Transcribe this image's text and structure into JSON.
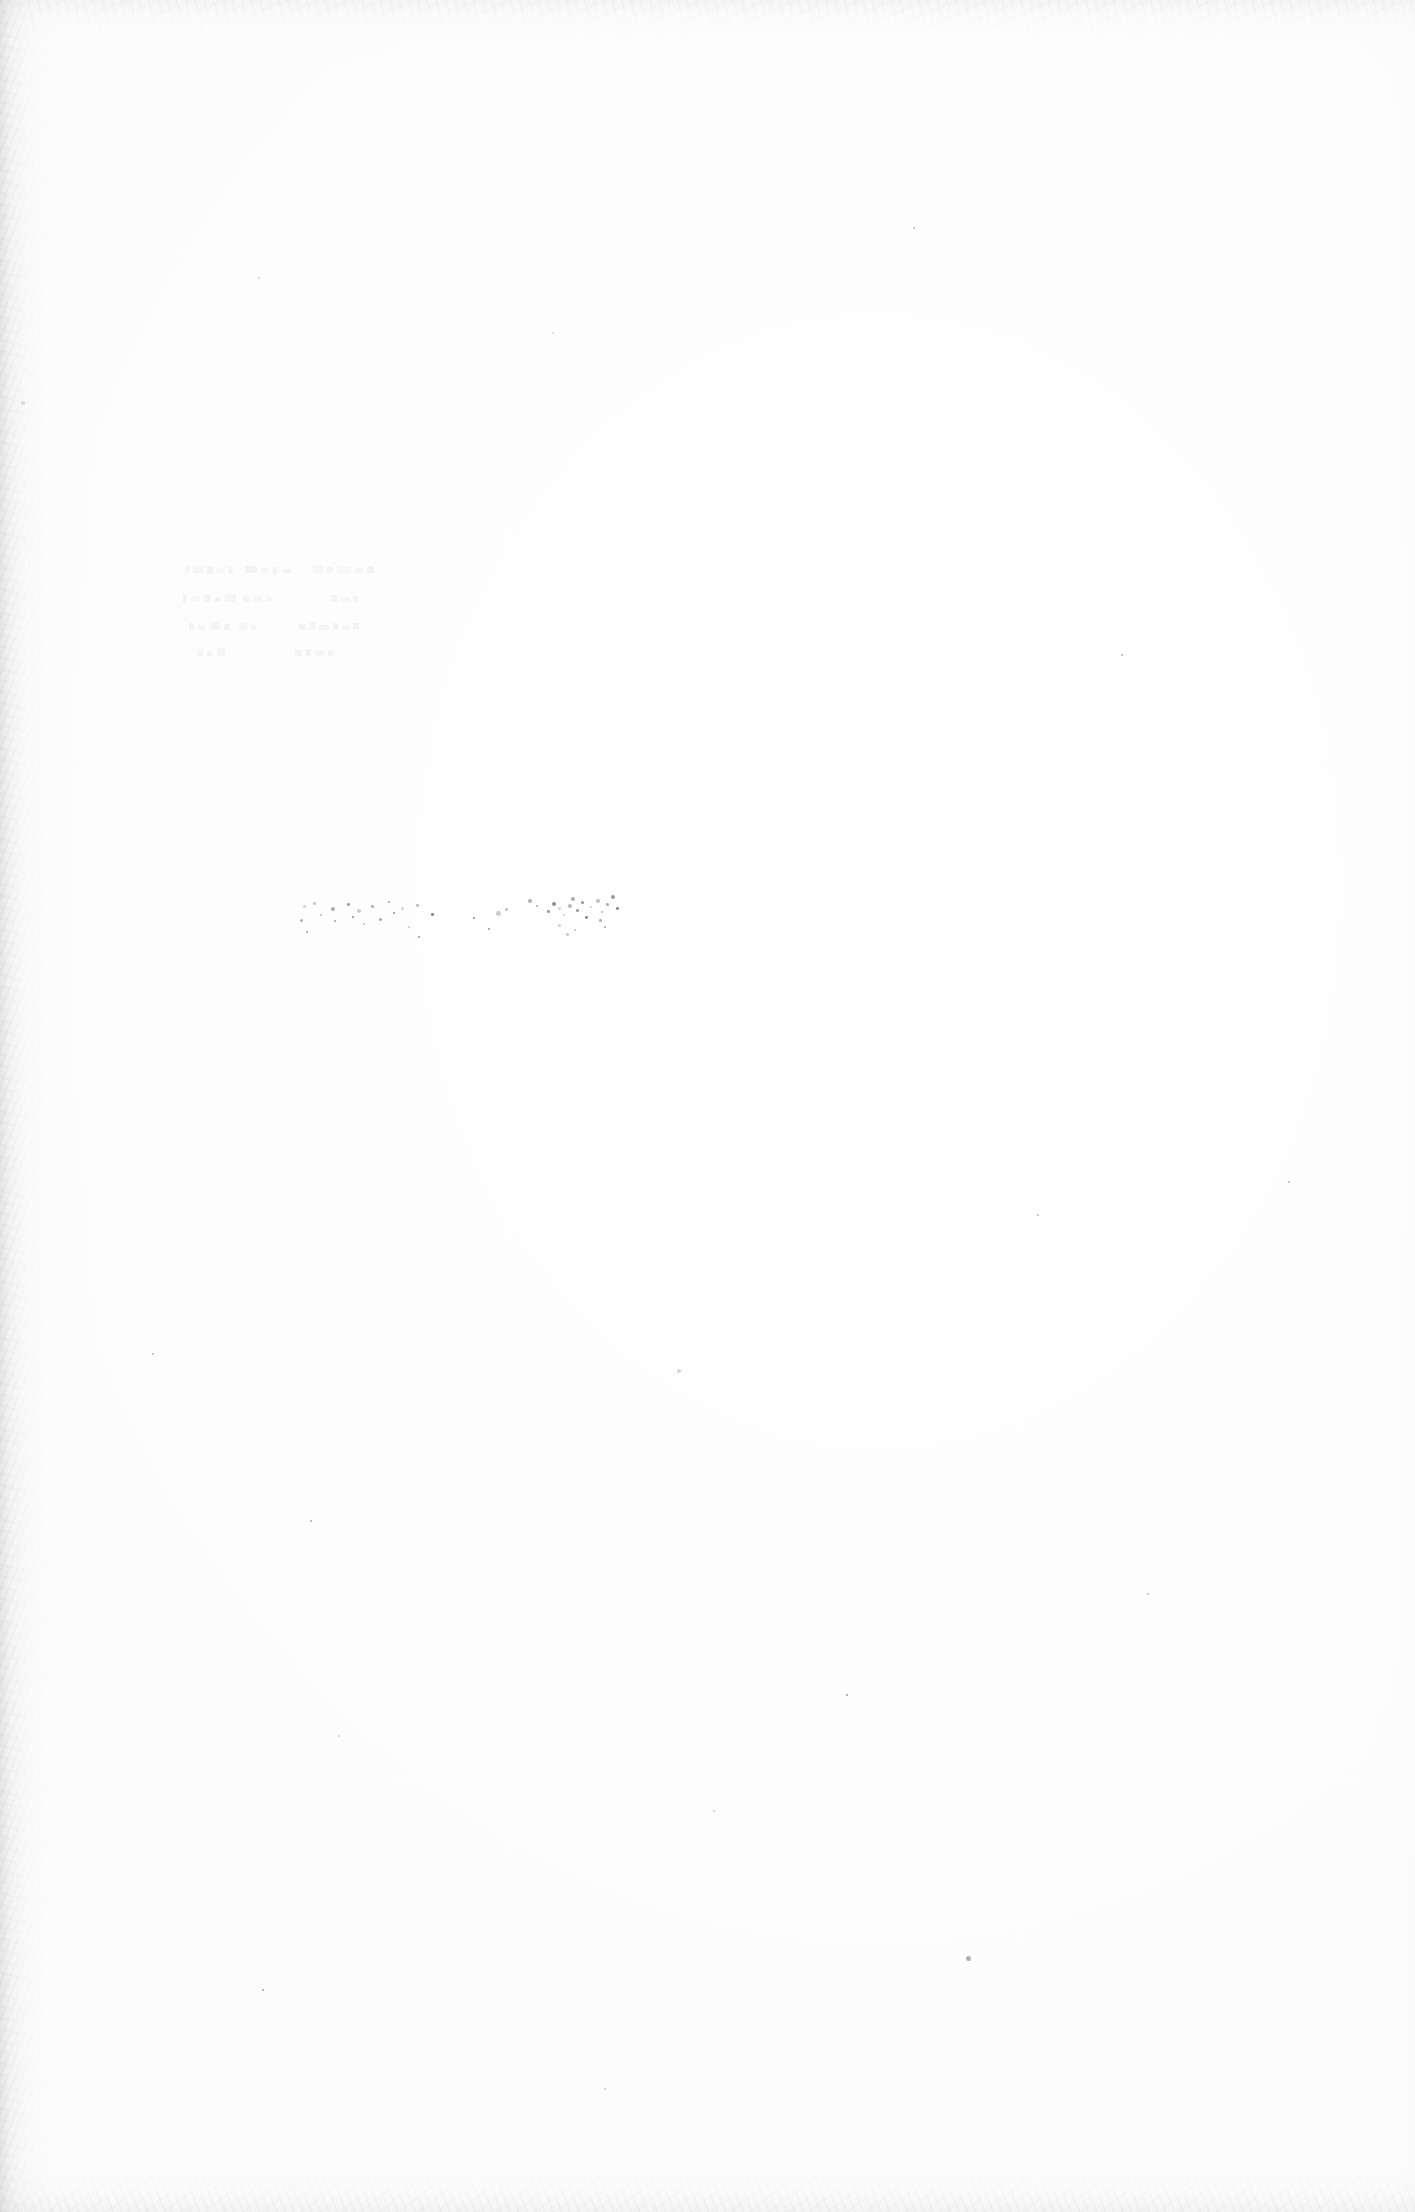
{
  "document": {
    "kind": "scanned-page",
    "orientation": "portrait",
    "page_width_px": 1415,
    "page_height_px": 2212,
    "visible_text": "",
    "legible_text_present": false,
    "description_label": "Blank scanned page with faint residual marks"
  },
  "colors": {
    "paper": "#fefefe",
    "paper_shade": "#fcfcfc",
    "edge_shadow": "#b0b0b2",
    "speck": "#6d6d72",
    "ghost_mark": "#9a9aa0"
  },
  "artifacts": {
    "edge_shadows": [
      {
        "name": "left-binding-shadow",
        "edge": "left",
        "extent_px": 95,
        "strength": 0.3
      },
      {
        "name": "top-edge-shadow",
        "edge": "top",
        "extent_px": 70,
        "strength": 0.13
      },
      {
        "name": "bottom-edge-shadow",
        "edge": "bottom",
        "extent_px": 85,
        "strength": 0.15
      },
      {
        "name": "right-edge-shadow",
        "edge": "right",
        "extent_px": 48,
        "strength": 0.06
      }
    ]
  },
  "ghost_text": {
    "present": true,
    "legible": false,
    "note": "Three short rows of faint, unreadable residual marks",
    "region": {
      "x": 183,
      "y": 563,
      "width": 198,
      "height": 100
    },
    "lines": [
      {
        "top": 0,
        "height": 13,
        "marks": [
          [
            2,
            2,
            5,
            9
          ],
          [
            10,
            4,
            10,
            6
          ],
          [
            24,
            3,
            6,
            8
          ],
          [
            33,
            5,
            9,
            5
          ],
          [
            45,
            4,
            5,
            7
          ],
          [
            62,
            3,
            12,
            7
          ],
          [
            78,
            5,
            7,
            5
          ],
          [
            90,
            4,
            4,
            8
          ],
          [
            100,
            6,
            8,
            4
          ],
          [
            130,
            2,
            10,
            8
          ],
          [
            144,
            4,
            6,
            6
          ],
          [
            154,
            3,
            14,
            8
          ],
          [
            172,
            5,
            8,
            5
          ],
          [
            184,
            3,
            7,
            7
          ]
        ]
      },
      {
        "top": 28,
        "height": 13,
        "marks": [
          [
            0,
            3,
            4,
            9
          ],
          [
            8,
            5,
            9,
            5
          ],
          [
            21,
            4,
            7,
            7
          ],
          [
            32,
            6,
            5,
            5
          ],
          [
            42,
            3,
            11,
            8
          ],
          [
            60,
            5,
            6,
            6
          ],
          [
            70,
            4,
            9,
            6
          ],
          [
            84,
            6,
            5,
            4
          ],
          [
            148,
            4,
            6,
            7
          ],
          [
            158,
            6,
            9,
            5
          ],
          [
            170,
            5,
            5,
            6
          ]
        ]
      },
      {
        "top": 56,
        "height": 13,
        "marks": [
          [
            6,
            4,
            5,
            8
          ],
          [
            15,
            6,
            7,
            5
          ],
          [
            27,
            3,
            10,
            8
          ],
          [
            41,
            5,
            6,
            6
          ],
          [
            56,
            4,
            8,
            7
          ],
          [
            68,
            6,
            5,
            5
          ],
          [
            116,
            5,
            7,
            6
          ],
          [
            126,
            3,
            6,
            8
          ],
          [
            136,
            6,
            10,
            5
          ],
          [
            150,
            4,
            5,
            7
          ],
          [
            159,
            6,
            8,
            5
          ],
          [
            170,
            4,
            6,
            6
          ]
        ]
      },
      {
        "top": 82,
        "height": 12,
        "marks": [
          [
            14,
            4,
            6,
            7
          ],
          [
            24,
            6,
            5,
            5
          ],
          [
            34,
            3,
            8,
            8
          ],
          [
            112,
            5,
            7,
            6
          ],
          [
            123,
            4,
            5,
            7
          ],
          [
            132,
            6,
            9,
            5
          ],
          [
            145,
            5,
            6,
            6
          ]
        ]
      }
    ]
  },
  "speckle": {
    "cluster": {
      "name": "dust-cluster",
      "region": {
        "x": 300,
        "y": 893,
        "width": 430,
        "height": 52
      },
      "points": [
        [
          3,
          12,
          1.6
        ],
        [
          13,
          9,
          1.3
        ],
        [
          20,
          21,
          1.1
        ],
        [
          31,
          14,
          1.8
        ],
        [
          34,
          27,
          1.2
        ],
        [
          47,
          10,
          1.4
        ],
        [
          52,
          23,
          1.0
        ],
        [
          57,
          16,
          2.0
        ],
        [
          63,
          30,
          1.1
        ],
        [
          71,
          12,
          1.3
        ],
        [
          79,
          25,
          1.5
        ],
        [
          88,
          8,
          1.2
        ],
        [
          93,
          19,
          1.1
        ],
        [
          101,
          14,
          1.7
        ],
        [
          108,
          33,
          1.0
        ],
        [
          116,
          11,
          1.4
        ],
        [
          0,
          26,
          1.5
        ],
        [
          6,
          38,
          1.2
        ],
        [
          118,
          43,
          1.1
        ],
        [
          131,
          20,
          1.3
        ],
        [
          196,
          18,
          2.4
        ],
        [
          205,
          15,
          1.4
        ],
        [
          228,
          6,
          1.9
        ],
        [
          236,
          12,
          1.1
        ],
        [
          247,
          17,
          1.3
        ],
        [
          252,
          9,
          2.1
        ],
        [
          258,
          14,
          1.5
        ],
        [
          263,
          21,
          1.2
        ],
        [
          268,
          11,
          1.8
        ],
        [
          271,
          4,
          2.2
        ],
        [
          276,
          16,
          1.3
        ],
        [
          281,
          8,
          1.6
        ],
        [
          285,
          23,
          1.4
        ],
        [
          290,
          13,
          1.1
        ],
        [
          296,
          6,
          1.9
        ],
        [
          301,
          18,
          1.2
        ],
        [
          306,
          10,
          1.5
        ],
        [
          311,
          2,
          2.0
        ],
        [
          316,
          14,
          1.3
        ],
        [
          258,
          31,
          1.7
        ],
        [
          266,
          40,
          1.4
        ],
        [
          274,
          36,
          1.2
        ],
        [
          299,
          26,
          1.3
        ],
        [
          304,
          33,
          1.1
        ],
        [
          188,
          35,
          1.0
        ],
        [
          173,
          24,
          0.9
        ]
      ]
    },
    "scattered": [
      {
        "name": "speck-upper-left-margin",
        "x": 21,
        "y": 401,
        "r": 2.0
      },
      {
        "name": "speck-mid-left",
        "x": 152,
        "y": 1353,
        "r": 1.1
      },
      {
        "name": "speck-mid-page",
        "x": 677,
        "y": 1369,
        "r": 1.9
      },
      {
        "name": "speck-lower-right",
        "x": 966,
        "y": 1956,
        "r": 2.3
      },
      {
        "name": "speck-lower-left",
        "x": 338,
        "y": 1735,
        "r": 1.0
      },
      {
        "name": "speck-right-upper",
        "x": 1121,
        "y": 654,
        "r": 1.0
      },
      {
        "name": "speck-center-low",
        "x": 713,
        "y": 1810,
        "r": 0.9
      },
      {
        "name": "speck-left-low",
        "x": 310,
        "y": 1520,
        "r": 1.0
      },
      {
        "name": "speck-right-mid",
        "x": 1037,
        "y": 1214,
        "r": 0.9
      },
      {
        "name": "speck-upper-center",
        "x": 552,
        "y": 332,
        "r": 0.9
      },
      {
        "name": "speck-upper-right",
        "x": 913,
        "y": 227,
        "r": 0.9
      },
      {
        "name": "speck-top-left",
        "x": 258,
        "y": 277,
        "r": 0.8
      },
      {
        "name": "speck-far-right",
        "x": 1288,
        "y": 1181,
        "r": 0.9
      },
      {
        "name": "speck-bottom-center",
        "x": 604,
        "y": 2088,
        "r": 0.9
      },
      {
        "name": "speck-bottom-left",
        "x": 262,
        "y": 1989,
        "r": 0.8
      },
      {
        "name": "speck-mid-right",
        "x": 1147,
        "y": 1593,
        "r": 0.8
      },
      {
        "name": "speck-low-center",
        "x": 846,
        "y": 1694,
        "r": 0.8
      }
    ]
  }
}
